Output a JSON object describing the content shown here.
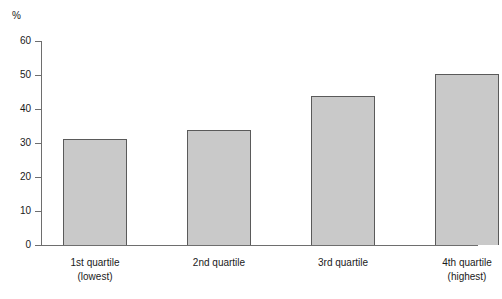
{
  "chart_data": {
    "type": "bar",
    "title": "",
    "subtitle": "",
    "xlabel": "",
    "ylabel": "%",
    "unit_label": "%",
    "categories": [
      "1st quartile",
      "2nd quartile",
      "3rd quartile",
      "4th quartile"
    ],
    "category_sublabels": [
      "(lowest)",
      "",
      "",
      "(highest)"
    ],
    "values": [
      31.3,
      33.8,
      43.7,
      50.3
    ],
    "ylim": [
      0,
      60
    ],
    "ytick_labels": [
      "0",
      "10",
      "20",
      "30",
      "40",
      "50",
      "60"
    ],
    "ytick_values": [
      0,
      10,
      20,
      30,
      40,
      50,
      60
    ],
    "grid": false,
    "legend": null,
    "legend_position": "none",
    "colors": {
      "bar_fill": "#c9c9c9",
      "bar_border": "#5a5a5a",
      "axis": "#6e6e6e",
      "text": "#1a1a1a",
      "background": "#ffffff"
    }
  }
}
